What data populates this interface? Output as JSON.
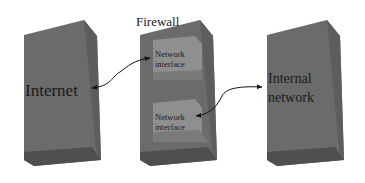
{
  "diagram": {
    "title": "Firewall",
    "nodes": [
      {
        "id": "internet",
        "label": "Internet"
      },
      {
        "id": "firewall",
        "label": "Firewall",
        "interfaces": [
          {
            "id": "nic1",
            "line1": "Network",
            "line2": "interface"
          },
          {
            "id": "nic2",
            "line1": "Network",
            "line2": "interface"
          }
        ]
      },
      {
        "id": "internal",
        "line1": "Internal",
        "line2": "network"
      }
    ],
    "edges": [
      {
        "from": "internet",
        "to": "nic1",
        "bidirectional": true
      },
      {
        "from": "nic2",
        "to": "internal",
        "bidirectional": true
      }
    ],
    "colors": {
      "box_front": "#6b6b6b",
      "box_side": "#5a5a5a",
      "box_bottom": "#4e4e4e",
      "interface_face": "#8f8f8f",
      "interface_shade": "#7a7a7a",
      "arrow": "#111111"
    }
  }
}
